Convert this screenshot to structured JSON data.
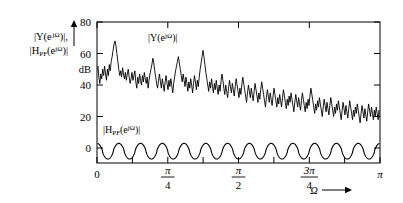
{
  "chart_data": {
    "type": "line",
    "title": "",
    "subtitle": "",
    "xlabel": "Ω",
    "xlabel_arrow": "→",
    "ylabel_line1": "|Y(e",
    "ylabel_line1_sup": "jΩ",
    "ylabel_line1_end": ")|,",
    "ylabel_line2_a": "|H",
    "ylabel_line2_sub": "PF",
    "ylabel_line2_b": "(e",
    "ylabel_line2_sup": "jΩ",
    "ylabel_line2_end": ")|",
    "yunit": "dB",
    "ylim": [
      -12,
      80
    ],
    "xlim": [
      0,
      3.14159265
    ],
    "grid": false,
    "legend_position": "inline-annotations",
    "yticks": [
      0,
      20,
      40,
      60,
      80
    ],
    "ytick_labels": [
      "0",
      "20",
      "40",
      "60",
      "80"
    ],
    "xticks": [
      0,
      0.7853981634,
      1.5707963268,
      2.3561944902,
      3.1415926536
    ],
    "xtick_labels": [
      "0",
      "π/4",
      "π/2",
      "3π/4",
      "π"
    ],
    "xtick_label_parts": [
      {
        "whole": "0"
      },
      {
        "num": "π",
        "den": "4"
      },
      {
        "num": "π",
        "den": "2"
      },
      {
        "num": "3π",
        "den": "4"
      },
      {
        "whole": "π"
      }
    ],
    "xminorticks": [
      0.3926990817,
      1.1780972451,
      1.9634954085,
      2.7488935719
    ],
    "series": [
      {
        "name": "|Y(e^{jΩ})|",
        "annotation": "|Y(e",
        "annotation_sup": "jΩ",
        "annotation_end": ")|",
        "annotation_x": 1.02,
        "annotation_y": 71,
        "description": "Noisy output magnitude spectrum in dB, decaying from about 55 dB near Ω=0 to about 25 dB near Ω=π, with a broad peak of about 68 dB near Ω=0.2 and heavy ripple of ±15 dB.",
        "values": [
          49,
          52,
          45,
          41,
          47,
          44,
          50,
          46,
          52,
          47,
          43,
          50,
          46,
          53,
          49,
          55,
          58,
          62,
          66,
          68,
          65,
          60,
          55,
          50,
          46,
          49,
          45,
          51,
          47,
          44,
          48,
          43,
          47,
          50,
          45,
          41,
          44,
          48,
          43,
          46,
          49,
          42,
          38,
          45,
          41,
          47,
          43,
          40,
          46,
          42,
          48,
          44,
          41,
          45,
          38,
          43,
          47,
          50,
          53,
          57,
          54,
          49,
          45,
          41,
          38,
          43,
          47,
          42,
          38,
          44,
          40,
          36,
          42,
          46,
          41,
          37,
          43,
          39,
          44,
          40,
          35,
          41,
          45,
          49,
          52,
          55,
          58,
          54,
          50,
          46,
          42,
          47,
          43,
          39,
          45,
          41,
          36,
          42,
          38,
          44,
          40,
          35,
          41,
          46,
          42,
          37,
          43,
          39,
          45,
          50,
          54,
          58,
          62,
          58,
          53,
          48,
          44,
          40,
          36,
          42,
          38,
          44,
          39,
          35,
          41,
          37,
          43,
          38,
          34,
          40,
          36,
          42,
          47,
          43,
          38,
          34,
          40,
          36,
          32,
          38,
          43,
          39,
          35,
          41,
          37,
          33,
          39,
          44,
          40,
          36,
          32,
          38,
          34,
          40,
          45,
          41,
          37,
          33,
          29,
          35,
          40,
          36,
          32,
          38,
          34,
          30,
          36,
          41,
          37,
          33,
          29,
          35,
          31,
          37,
          42,
          38,
          34,
          30,
          26,
          32,
          37,
          33,
          29,
          35,
          31,
          27,
          33,
          38,
          34,
          30,
          26,
          32,
          28,
          34,
          30,
          26,
          32,
          37,
          33,
          29,
          25,
          31,
          27,
          33,
          29,
          35,
          31,
          27,
          23,
          29,
          34,
          30,
          26,
          32,
          28,
          24,
          30,
          35,
          31,
          27,
          23,
          29,
          25,
          31,
          27,
          33,
          38,
          34,
          30,
          26,
          22,
          28,
          24,
          30,
          26,
          32,
          28,
          24,
          20,
          26,
          31,
          27,
          23,
          29,
          25,
          21,
          27,
          32,
          28,
          24,
          20,
          26,
          22,
          28,
          24,
          30,
          26,
          22,
          18,
          24,
          29,
          25,
          21,
          27,
          23,
          19,
          25,
          30,
          26,
          22,
          18,
          24,
          20,
          26,
          22,
          28,
          24,
          20,
          16,
          22,
          27,
          23,
          19,
          25,
          21,
          17,
          23,
          28,
          24,
          20,
          26,
          22,
          18,
          24,
          20,
          26,
          22,
          18,
          24,
          20
        ]
      },
      {
        "name": "|H_PF(e^{jΩ})|",
        "annotation": "|H",
        "annotation_sub": "PF",
        "annotation_mid": "(e",
        "annotation_sup": "jΩ",
        "annotation_end": ")|",
        "annotation_x": 0.17,
        "annotation_y": 14,
        "description": "Comb / peaking-filter magnitude response in dB oscillating between about +3 dB and -7 dB with roughly 13 ripple cycles across 0 to π.",
        "ripple_cycles": 13,
        "peak_db": 3,
        "trough_db": -7
      }
    ]
  }
}
